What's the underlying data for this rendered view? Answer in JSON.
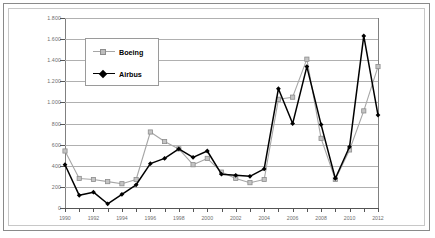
{
  "chart_data": {
    "type": "line",
    "title": "",
    "subtitle": "",
    "xlabel": "",
    "ylabel": "",
    "grid": true,
    "legend_position": "upper-left-inside",
    "xlim": [
      1990,
      2012
    ],
    "ylim": [
      0,
      1800
    ],
    "y_ticks": [
      "0",
      "200",
      "400",
      "600",
      "800",
      "1.000",
      "1.200",
      "1.400",
      "1.600",
      "1.800"
    ],
    "y_tick_values": [
      0,
      200,
      400,
      600,
      800,
      1000,
      1200,
      1400,
      1600,
      1800
    ],
    "x": [
      1990,
      1991,
      1992,
      1993,
      1994,
      1995,
      1996,
      1997,
      1998,
      1999,
      2000,
      2001,
      2002,
      2003,
      2004,
      2005,
      2006,
      2007,
      2008,
      2009,
      2010,
      2011,
      2012
    ],
    "x_tick_labels": [
      "1990",
      "1992",
      "1994",
      "1996",
      "1998",
      "2000",
      "2002",
      "2004",
      "2006",
      "2008",
      "2010",
      "2012"
    ],
    "x_tick_values": [
      1990,
      1992,
      1994,
      1996,
      1998,
      2000,
      2002,
      2004,
      2006,
      2008,
      2010,
      2012
    ],
    "series": [
      {
        "name": "Boeing",
        "color": "#a6a6a6",
        "marker": "square",
        "values": [
          540,
          280,
          270,
          250,
          230,
          270,
          720,
          630,
          560,
          410,
          470,
          340,
          280,
          240,
          270,
          1030,
          1050,
          1410,
          660,
          270,
          550,
          920,
          1340
        ]
      },
      {
        "name": "Airbus",
        "color": "#000000",
        "marker": "diamond",
        "values": [
          410,
          120,
          150,
          40,
          130,
          220,
          420,
          470,
          560,
          480,
          540,
          320,
          310,
          300,
          370,
          1130,
          800,
          1340,
          790,
          280,
          580,
          1630,
          880
        ]
      }
    ]
  },
  "legend": {
    "items": [
      {
        "label": "Boeing"
      },
      {
        "label": "Airbus"
      }
    ]
  }
}
